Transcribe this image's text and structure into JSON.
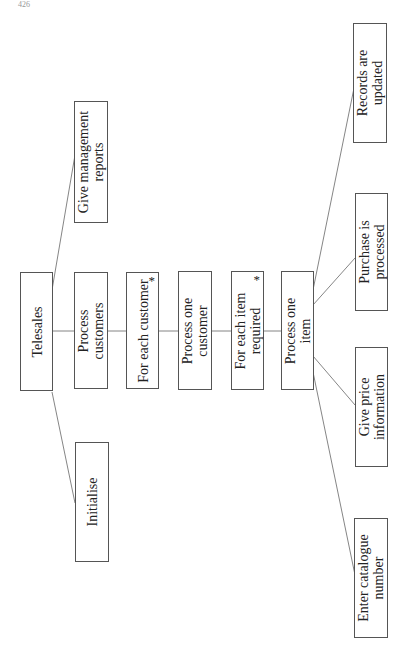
{
  "page": {
    "page_number": "426",
    "header_right": ""
  },
  "diagram": {
    "type": "structure-chart",
    "orientation": "rotated-90-ccw",
    "root": {
      "id": "telesales",
      "label": "Telesales",
      "children": [
        {
          "id": "initialise",
          "label": "Initialise",
          "iteration": false
        },
        {
          "id": "process-customers",
          "label": "Process customers",
          "iteration": false,
          "children": [
            {
              "id": "for-each-customer",
              "label": "For each customer",
              "iteration": true,
              "children": [
                {
                  "id": "process-one-customer",
                  "label": "Process one customer",
                  "iteration": false,
                  "children": [
                    {
                      "id": "for-each-item-required",
                      "label": "For each item required",
                      "iteration": true,
                      "children": [
                        {
                          "id": "process-one-item",
                          "label": "Process one item",
                          "iteration": false,
                          "children": [
                            {
                              "id": "enter-catalogue-number",
                              "label": "Enter catalogue number"
                            },
                            {
                              "id": "give-price-information",
                              "label": "Give price information"
                            },
                            {
                              "id": "purchase-is-processed",
                              "label": "Purchase is processed"
                            },
                            {
                              "id": "records-are-updated",
                              "label": "Records are updated"
                            }
                          ]
                        }
                      ]
                    }
                  ]
                }
              ]
            }
          ]
        },
        {
          "id": "give-management-reports",
          "label": "Give management reports",
          "iteration": false
        }
      ]
    },
    "labels": {
      "telesales": "Telesales",
      "initialise": "Initialise",
      "process_customers": "Process customers",
      "give_management_reports_1": "Give management",
      "give_management_reports_2": "reports",
      "process_customers_1": "Process",
      "process_customers_2": "customers",
      "for_each_customer": "For each customer",
      "process_one_customer_1": "Process one",
      "process_one_customer_2": "customer",
      "for_each_item_required_1": "For each item",
      "for_each_item_required_2": "required",
      "process_one_item_1": "Process one",
      "process_one_item_2": "item",
      "enter_catalogue_number_1": "Enter catalogue",
      "enter_catalogue_number_2": "number",
      "give_price_information_1": "Give price",
      "give_price_information_2": "information",
      "purchase_is_processed_1": "Purchase is",
      "purchase_is_processed_2": "processed",
      "records_are_updated_1": "Records are",
      "records_are_updated_2": "updated",
      "iteration_marker": "*"
    },
    "colors": {
      "line": "#555555",
      "box_border": "#555555",
      "text": "#222222"
    }
  }
}
